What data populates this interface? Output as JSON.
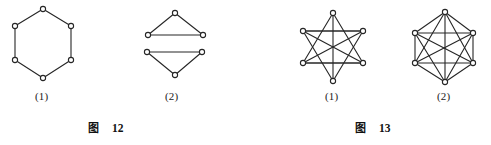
{
  "page": {
    "width": 491,
    "height": 145,
    "background": "#ffffff",
    "ink_color": "#262626",
    "vertex_fill": "#ffffff"
  },
  "figures": [
    {
      "caption_cjk": "图",
      "caption_number": "12",
      "caption_x": 88,
      "caption_y": 119,
      "panels": [
        {
          "label": "(1)",
          "label_x": 35,
          "label_y": 90,
          "name": "hexagon-cycle-graph",
          "description": "six-vertex cycle drawn as a regular hexagon",
          "vertices": [
            {
              "id": "v1",
              "x": 43,
              "y": 9
            },
            {
              "id": "v2",
              "x": 15,
              "y": 26
            },
            {
              "id": "v3",
              "x": 15,
              "y": 60
            },
            {
              "id": "v4",
              "x": 43,
              "y": 78
            },
            {
              "id": "v5",
              "x": 71,
              "y": 60
            },
            {
              "id": "v6",
              "x": 71,
              "y": 26
            }
          ],
          "edges": [
            [
              "v1",
              "v2"
            ],
            [
              "v2",
              "v3"
            ],
            [
              "v3",
              "v4"
            ],
            [
              "v4",
              "v5"
            ],
            [
              "v5",
              "v6"
            ],
            [
              "v6",
              "v1"
            ]
          ]
        },
        {
          "label": "(2)",
          "label_x": 165,
          "label_y": 90,
          "name": "two-triangles-graph",
          "description": "two disjoint triangles, upper apex-up and lower apex-down",
          "vertices": [
            {
              "id": "a1",
              "x": 175,
              "y": 13
            },
            {
              "id": "a2",
              "x": 148,
              "y": 35
            },
            {
              "id": "a3",
              "x": 203,
              "y": 35
            },
            {
              "id": "b1",
              "x": 147,
              "y": 52
            },
            {
              "id": "b2",
              "x": 202,
              "y": 52
            },
            {
              "id": "b3",
              "x": 175,
              "y": 75
            }
          ],
          "edges": [
            [
              "a1",
              "a2"
            ],
            [
              "a2",
              "a3"
            ],
            [
              "a3",
              "a1"
            ],
            [
              "b1",
              "b2"
            ],
            [
              "b2",
              "b3"
            ],
            [
              "b3",
              "b1"
            ]
          ]
        }
      ]
    },
    {
      "caption_cjk": "图",
      "caption_number": "13",
      "caption_x": 355,
      "caption_y": 119,
      "panels": [
        {
          "label": "(1)",
          "label_x": 325,
          "label_y": 90,
          "name": "complete-graph-hexagonal-layout",
          "description": "six vertices on a hexagon with all fifteen connecting chords drawn, producing a star pattern",
          "vertices": [
            {
              "id": "p1",
              "x": 333,
              "y": 13
            },
            {
              "id": "p2",
              "x": 303,
              "y": 31
            },
            {
              "id": "p3",
              "x": 303,
              "y": 63
            },
            {
              "id": "p4",
              "x": 333,
              "y": 81
            },
            {
              "id": "p5",
              "x": 363,
              "y": 63
            },
            {
              "id": "p6",
              "x": 363,
              "y": 31
            }
          ],
          "edges": [
            [
              "p1",
              "p3"
            ],
            [
              "p1",
              "p4"
            ],
            [
              "p1",
              "p5"
            ],
            [
              "p2",
              "p4"
            ],
            [
              "p2",
              "p5"
            ],
            [
              "p2",
              "p6"
            ],
            [
              "p3",
              "p5"
            ],
            [
              "p3",
              "p6"
            ],
            [
              "p4",
              "p6"
            ],
            [
              "p2",
              "p6"
            ],
            [
              "p3",
              "p5"
            ]
          ]
        },
        {
          "label": "(2)",
          "label_x": 437,
          "label_y": 90,
          "name": "complete-graph-tall-layout",
          "description": "six vertices arranged tall with vertical side edges and all crossing chords",
          "vertices": [
            {
              "id": "q1",
              "x": 445,
              "y": 12
            },
            {
              "id": "q2",
              "x": 415,
              "y": 33
            },
            {
              "id": "q3",
              "x": 415,
              "y": 63
            },
            {
              "id": "q4",
              "x": 445,
              "y": 82
            },
            {
              "id": "q5",
              "x": 473,
              "y": 63
            },
            {
              "id": "q6",
              "x": 473,
              "y": 33
            }
          ],
          "edges": [
            [
              "q2",
              "q3"
            ],
            [
              "q5",
              "q6"
            ],
            [
              "q1",
              "q4"
            ],
            [
              "q1",
              "q2"
            ],
            [
              "q1",
              "q3"
            ],
            [
              "q1",
              "q5"
            ],
            [
              "q1",
              "q6"
            ],
            [
              "q2",
              "q4"
            ],
            [
              "q2",
              "q5"
            ],
            [
              "q2",
              "q6"
            ],
            [
              "q3",
              "q4"
            ],
            [
              "q3",
              "q5"
            ],
            [
              "q3",
              "q6"
            ],
            [
              "q4",
              "q5"
            ],
            [
              "q4",
              "q6"
            ]
          ]
        }
      ]
    }
  ]
}
